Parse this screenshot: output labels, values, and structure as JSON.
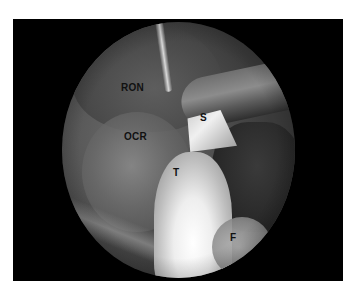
{
  "figure": {
    "frame_color": "#000000",
    "page_background": "#ffffff",
    "labels": [
      {
        "id": "ron",
        "text": "RON",
        "x": 121,
        "y": 83
      },
      {
        "id": "ocr",
        "text": "OCR",
        "x": 124,
        "y": 132
      },
      {
        "id": "s",
        "text": "S",
        "x": 200,
        "y": 113
      },
      {
        "id": "t",
        "text": "T",
        "x": 173,
        "y": 168
      },
      {
        "id": "f",
        "text": "F",
        "x": 230,
        "y": 233
      }
    ]
  }
}
